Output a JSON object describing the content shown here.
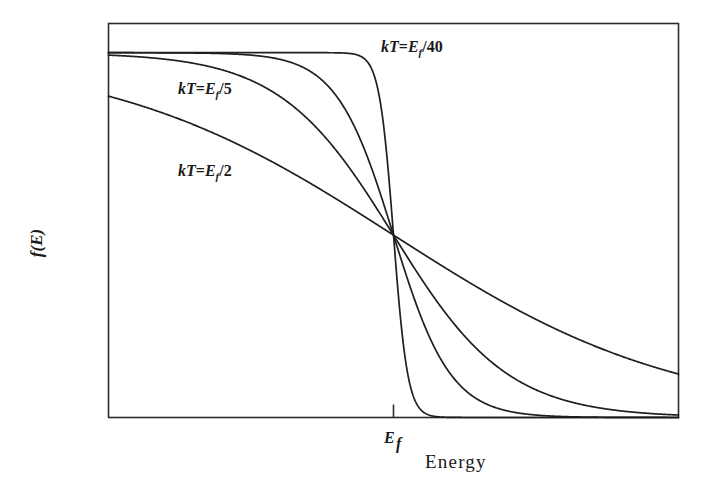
{
  "figure": {
    "background_color": "#ffffff",
    "line_color": "#1f1f1f",
    "frame_color": "#2b2b2b"
  },
  "axes": {
    "x_title": "Energy",
    "y_title": "f(E)",
    "x_tick_label": "E",
    "x_tick_sub": "f",
    "x_tick_position_fraction": 0.5
  },
  "annotations": [
    {
      "id": "ann-kt-40",
      "lead": "kT",
      "eq": "=",
      "sym": "E",
      "sub": "f",
      "slash": "/",
      "denom": "40",
      "x": 381,
      "y": 52
    },
    {
      "id": "ann-kt-5",
      "lead": "kT",
      "eq": "=",
      "sym": "E",
      "sub": "f",
      "slash": "/",
      "denom": "5",
      "x": 178,
      "y": 94
    },
    {
      "id": "ann-kt-2",
      "lead": "kT",
      "eq": "=",
      "sym": "E",
      "sub": "f",
      "slash": "/",
      "denom": "2",
      "x": 178,
      "y": 176
    }
  ],
  "chart_data": {
    "type": "line",
    "title": "",
    "subtitle": "",
    "xlabel": "Energy",
    "ylabel": "f(E)",
    "grid": false,
    "legend_position": "inline-annotations",
    "xlim": [
      0,
      2
    ],
    "ylim": [
      0,
      1.08
    ],
    "x_tick_values": [
      1
    ],
    "x_tick_labels": [
      "E_f"
    ],
    "y_tick_values": [],
    "y_tick_labels": [],
    "x": [
      0,
      0.1,
      0.2,
      0.3,
      0.4,
      0.5,
      0.6,
      0.7,
      0.8,
      0.85,
      0.9,
      0.95,
      1.0,
      1.05,
      1.1,
      1.15,
      1.2,
      1.3,
      1.4,
      1.5,
      1.6,
      1.7,
      1.8,
      1.9,
      2.0
    ],
    "series": [
      {
        "name": "kT=E_f/40",
        "kT": 0.025,
        "labeled": true,
        "values": [
          1.0,
          1.0,
          1.0,
          1.0,
          1.0,
          1.0,
          1.0,
          1.0,
          0.9997,
          0.9975,
          0.982,
          0.881,
          0.5,
          0.119,
          0.018,
          0.0025,
          0.0003,
          0.0,
          0.0,
          0.0,
          0.0,
          0.0,
          0.0,
          0.0,
          0.0
        ]
      },
      {
        "name": "kT=E_f/10",
        "kT": 0.1,
        "labeled": false,
        "values": [
          1.0,
          0.9999,
          0.9997,
          0.9991,
          0.9975,
          0.9933,
          0.982,
          0.953,
          0.881,
          0.818,
          0.731,
          0.622,
          0.5,
          0.378,
          0.269,
          0.182,
          0.119,
          0.047,
          0.018,
          0.0067,
          0.0025,
          0.0009,
          0.0003,
          0.0001,
          0.0
        ]
      },
      {
        "name": "kT=E_f/5",
        "kT": 0.2,
        "labeled": true,
        "values": [
          0.9933,
          0.989,
          0.982,
          0.9707,
          0.953,
          0.9241,
          0.881,
          0.818,
          0.731,
          0.679,
          0.622,
          0.562,
          0.5,
          0.438,
          0.378,
          0.321,
          0.269,
          0.182,
          0.119,
          0.0759,
          0.047,
          0.0289,
          0.018,
          0.011,
          0.0067
        ]
      },
      {
        "name": "kT=E_f/2",
        "kT": 0.5,
        "labeled": true,
        "values": [
          0.881,
          0.858,
          0.832,
          0.802,
          0.769,
          0.731,
          0.69,
          0.646,
          0.599,
          0.574,
          0.55,
          0.525,
          0.5,
          0.475,
          0.45,
          0.426,
          0.401,
          0.354,
          0.31,
          0.269,
          0.231,
          0.198,
          0.168,
          0.142,
          0.119
        ]
      }
    ]
  }
}
